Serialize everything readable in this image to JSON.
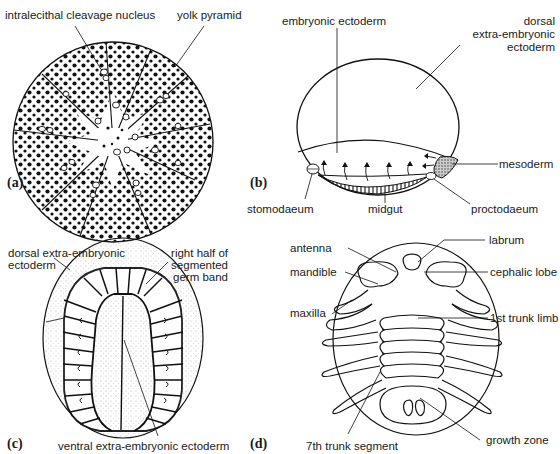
{
  "panels": [
    {
      "id": "a",
      "letter": "(a)",
      "labels": {
        "intralecithal_cleavage_nucleus": "intralecithal cleavage nucleus",
        "yolk_pyramid": "yolk pyramid"
      }
    },
    {
      "id": "b",
      "letter": "(b)",
      "labels": {
        "embryonic_ectoderm": "embryonic ectoderm",
        "dorsal_extra_1": "dorsal",
        "dorsal_extra_2": "extra-embryonic",
        "dorsal_extra_3": "ectoderm",
        "mesoderm": "mesoderm",
        "stomodaeum": "stomodaeum",
        "midgut": "midgut",
        "proctodaeum": "proctodaeum"
      }
    },
    {
      "id": "c",
      "letter": "(c)",
      "labels": {
        "dorsal_extra_1": "dorsal extra-embryonic",
        "dorsal_extra_2": "ectoderm",
        "right_half_1": "right half of",
        "right_half_2": "segmented",
        "right_half_3": "germ band",
        "ventral_extra": "ventral extra-embryonic ectoderm"
      }
    },
    {
      "id": "d",
      "letter": "(d)",
      "labels": {
        "antenna": "antenna",
        "mandible": "mandible",
        "maxilla": "maxilla",
        "labrum": "labrum",
        "cephalic_lobe": "cephalic lobe",
        "first_trunk_limb": "1st trunk limb",
        "seventh_trunk_segment": "7th trunk segment",
        "growth_zone": "growth zone"
      }
    }
  ]
}
